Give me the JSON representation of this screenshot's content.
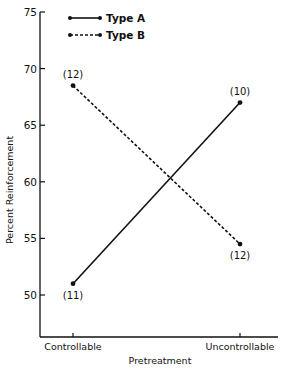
{
  "chart_data": {
    "type": "line",
    "title": "",
    "xlabel": "Pretreatment",
    "ylabel": "Percent Reinforcement",
    "categories": [
      "Controllable",
      "Uncontrollable"
    ],
    "ylim": [
      46,
      75
    ],
    "yticks": [
      50,
      55,
      60,
      65,
      70,
      75
    ],
    "grid": false,
    "legend_position": "top-left",
    "series": [
      {
        "name": "Type A",
        "style": "solid",
        "values": [
          51,
          67
        ],
        "n_labels": [
          "(11)",
          "(10)"
        ]
      },
      {
        "name": "Type B",
        "style": "dashed",
        "values": [
          68.5,
          54.5
        ],
        "n_labels": [
          "(12)",
          "(12)"
        ]
      }
    ]
  }
}
